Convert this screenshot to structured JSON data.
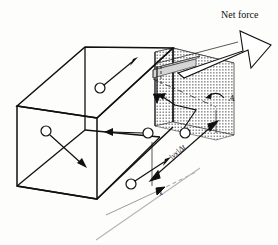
{
  "figure": {
    "labels": {
      "net_force": "Net force",
      "area": "A",
      "axis_x": "x",
      "slab_thickness": "|vx|Δt"
    },
    "colors": {
      "ink": "#101010",
      "shade_fill": "#b8b8b8",
      "paper": "#fdfdfc",
      "plate_fill": "#d8d8d8"
    },
    "geometry": {
      "box_description": "rectangular container drawn in oblique projection",
      "shaded_slab_description": "gray shaded slab at right end of box",
      "wall_face_description": "right end face of box labelled A",
      "slab_thickness_label": "|vx|Δt",
      "length_axis_label": "x"
    },
    "molecules": [
      {
        "id": "m1",
        "cx": 100,
        "cy": 88,
        "r": 5,
        "vx": 36,
        "vy": -27,
        "note": "upper-left molecule moving up-right"
      },
      {
        "id": "m2",
        "cx": 46,
        "cy": 131,
        "r": 5,
        "vx": 36,
        "vy": 33,
        "note": "left molecule moving down-right"
      },
      {
        "id": "m3",
        "cx": 148,
        "cy": 133,
        "r": 5,
        "vx": -38,
        "vy": -2,
        "note": "middle molecule moving left (-x)"
      },
      {
        "id": "m4",
        "cx": 131,
        "cy": 184,
        "r": 5,
        "vx": 40,
        "vy": -28,
        "note": "lower molecule moving up-right toward wall"
      },
      {
        "id": "m5",
        "cx": 185,
        "cy": 133,
        "r": 5,
        "vx": -30,
        "vy": -26,
        "note": "molecule rebounding off wall, zigzag path"
      }
    ],
    "arrows": {
      "net_force": {
        "type": "hollow-block-arrow",
        "direction": "up-right",
        "label": "Net force"
      },
      "area_pointer": {
        "type": "curved-thin-arrow",
        "points_to": "shaded end face",
        "label": "A"
      },
      "dimension_slab": {
        "type": "double-headed",
        "label": "|vx|Δt"
      },
      "dimension_x": {
        "type": "double-headed",
        "label": "x"
      }
    }
  }
}
